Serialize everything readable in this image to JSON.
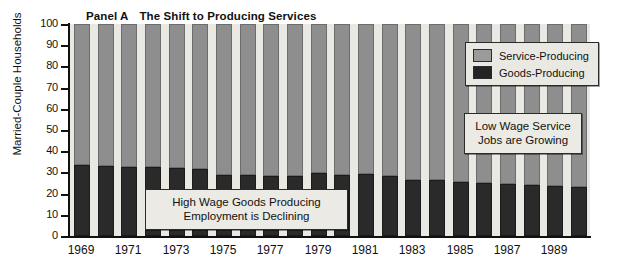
{
  "chart_data": {
    "type": "bar",
    "subtype": "stacked-100",
    "panel_label": "Panel A",
    "title_text": "The Shift to Producing Services",
    "xlabel": "",
    "ylabel": "Married-Couple Households",
    "ylim": [
      0,
      100
    ],
    "yticks": [
      0,
      10,
      20,
      30,
      40,
      50,
      60,
      70,
      80,
      90,
      100
    ],
    "ytick_labels": [
      "0",
      "10",
      "20",
      "30",
      "40",
      "50",
      "60",
      "70",
      "80",
      "90",
      "100"
    ],
    "grid": false,
    "legend_position": "upper-right",
    "categories": [
      1969,
      1970,
      1971,
      1972,
      1973,
      1974,
      1975,
      1976,
      1977,
      1978,
      1979,
      1980,
      1981,
      1982,
      1983,
      1984,
      1985,
      1986,
      1987,
      1988,
      1989,
      1990
    ],
    "xtick_labels": [
      "1969",
      "1971",
      "1973",
      "1975",
      "1977",
      "1979",
      "1981",
      "1983",
      "1985",
      "1987",
      "1989"
    ],
    "xticks_shown": [
      1969,
      1971,
      1973,
      1975,
      1977,
      1979,
      1981,
      1983,
      1985,
      1987,
      1989
    ],
    "series": [
      {
        "name": "Goods-Producing",
        "color": "#2a2a2a",
        "values": [
          33.5,
          33.0,
          32.7,
          32.6,
          32.2,
          31.5,
          28.9,
          28.7,
          28.5,
          28.4,
          29.7,
          28.9,
          29.1,
          28.4,
          26.6,
          26.5,
          25.6,
          25.0,
          24.6,
          24.2,
          23.6,
          23.0
        ]
      },
      {
        "name": "Service-Producing",
        "color": "#8e8e8e",
        "values": [
          66.5,
          67.0,
          67.3,
          67.4,
          67.8,
          68.5,
          71.1,
          71.3,
          71.5,
          71.6,
          70.3,
          71.1,
          70.9,
          71.6,
          73.4,
          73.5,
          74.4,
          75.0,
          75.4,
          75.8,
          76.4,
          77.0
        ]
      }
    ],
    "legend": [
      {
        "label": "Service-Producing",
        "color": "#9b9b9b"
      },
      {
        "label": "Goods-Producing",
        "color": "#242424"
      }
    ],
    "annotations": [
      {
        "id": "goods",
        "lines": [
          "High Wage Goods Producing",
          "Employment is Declining"
        ]
      },
      {
        "id": "service",
        "lines": [
          "Low Wage Service",
          "Jobs are Growing"
        ]
      }
    ]
  }
}
